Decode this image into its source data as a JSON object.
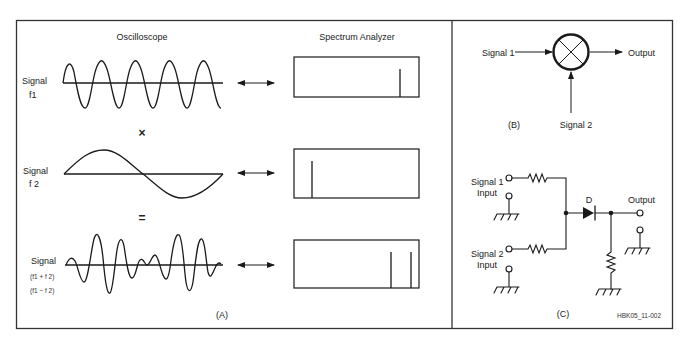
{
  "panel_a": {
    "label": "(A)",
    "header_oscilloscope": "Oscilloscope",
    "header_spectrum": "Spectrum Analyzer",
    "rows": [
      {
        "signal_label": "Signal",
        "freq_label": "f1",
        "freq_label_2": "",
        "operator_below": "×"
      },
      {
        "signal_label": "Signal",
        "freq_label": "f 2",
        "freq_label_2": "",
        "operator_below": "="
      },
      {
        "signal_label": "Signal",
        "freq_label": "(f1 + f 2)",
        "freq_label_2": "(f1 − f 2)",
        "operator_below": ""
      }
    ]
  },
  "panel_b": {
    "label": "(B)",
    "input1": "Signal 1",
    "input2": "Signal 2",
    "output": "Output"
  },
  "panel_c": {
    "label": "(C)",
    "input1_line1": "Signal 1",
    "input1_line2": "Input",
    "input2_line1": "Signal 2",
    "input2_line2": "Input",
    "diode_label": "D",
    "output": "Output"
  },
  "figure_id": "HBK05_11-002",
  "colors": {
    "ink": "#1a1a1a",
    "background": "#ffffff",
    "frame": "#333333"
  }
}
